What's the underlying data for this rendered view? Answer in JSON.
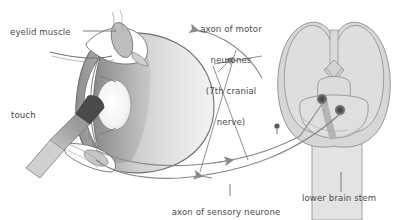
{
  "figure": {
    "domain": "anatomy-diagram",
    "background_color": "#fefefe",
    "line_color": "#5a5a5a",
    "text_color": "#4b4b4b",
    "fill_light": "#d9d9d9",
    "fill_mid": "#bdbdbd",
    "fill_dark": "#6e6e6e",
    "fill_sclera": "#ffffff",
    "fill_lens": "#f2f2f0"
  },
  "labels": {
    "eyelid_muscle": "eyelid muscle",
    "touch": "touch",
    "motor_line1": "axon of motor",
    "motor_line2": "neurones",
    "motor_line3": "(7th cranial",
    "motor_line4": "nerve)",
    "sensory_line1": "axon of sensory neurone",
    "sensory_line2": "(5th cranial nerve)",
    "lower_brain_stem": "lower brain stem"
  },
  "structures": {
    "eye": "eyeball with cornea and lens",
    "eyelid_muscle": "orbicularis oculi muscle oval",
    "probe": "cotton swab touching cornea",
    "brain": "lower brain stem with cerebellar lobes",
    "nucleus_motor": "motor nucleus dot",
    "nucleus_sensory": "sensory nucleus dot",
    "pathway_sensory": "sensory arc from eye to brain stem",
    "pathway_motor": "motor arc from brain stem to eyelid"
  },
  "arrows": {
    "sensory_direction": "toward brain stem",
    "motor_direction": "toward eyelid muscle",
    "motor_leader_direction": "toward motor arc"
  }
}
